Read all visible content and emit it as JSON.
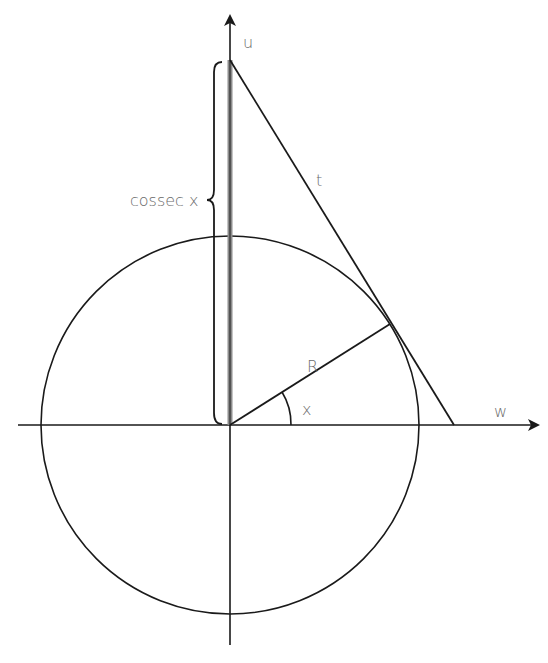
{
  "diagram": {
    "labels": {
      "u_axis": "u",
      "w_axis": "w",
      "tangent": "t",
      "radius": "R",
      "angle": "x",
      "cosec": "cossec x"
    },
    "colors": {
      "line": "#1a1a1a",
      "cosec_bar": "#8c8c8c",
      "label": "#6b6b6b"
    }
  }
}
